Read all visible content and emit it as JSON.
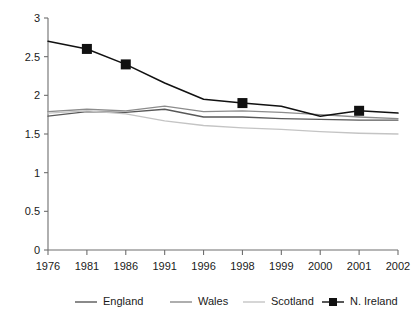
{
  "chart_data": {
    "type": "line",
    "title": "",
    "xlabel": "",
    "ylabel": "",
    "categories": [
      "1976",
      "1981",
      "1986",
      "1991",
      "1996",
      "1998",
      "1999",
      "2000",
      "2001",
      "2002"
    ],
    "ylim": [
      0,
      3
    ],
    "yticks": [
      "0",
      "0.5",
      "1",
      "1.5",
      "2",
      "2.5",
      "3"
    ],
    "ytick_values": [
      0,
      0.5,
      1,
      1.5,
      2,
      2.5,
      3
    ],
    "grid": false,
    "legend_position": "bottom",
    "series": [
      {
        "name": "England",
        "color": "#585858",
        "marker": "none",
        "values": [
          1.73,
          1.79,
          1.78,
          1.82,
          1.72,
          1.72,
          1.7,
          1.69,
          1.68,
          1.68
        ]
      },
      {
        "name": "Wales",
        "color": "#8c8c8c",
        "marker": "none",
        "values": [
          1.79,
          1.82,
          1.8,
          1.86,
          1.79,
          1.8,
          1.78,
          1.75,
          1.72,
          1.7
        ]
      },
      {
        "name": "Scotland",
        "color": "#c4c4c4",
        "marker": "none",
        "values": [
          1.77,
          1.8,
          1.76,
          1.67,
          1.61,
          1.58,
          1.56,
          1.53,
          1.51,
          1.5
        ]
      },
      {
        "name": "N. Ireland",
        "color": "#111111",
        "marker": "square",
        "values": [
          2.7,
          2.6,
          2.4,
          2.16,
          1.95,
          1.9,
          1.86,
          1.73,
          1.8,
          1.77
        ]
      }
    ]
  },
  "legend": {
    "items": [
      {
        "label": "England"
      },
      {
        "label": "Wales"
      },
      {
        "label": "Scotland"
      },
      {
        "label": "N. Ireland"
      }
    ]
  }
}
